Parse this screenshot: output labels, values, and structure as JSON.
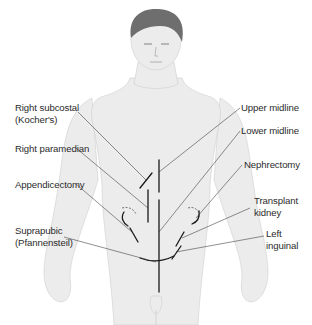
{
  "figure": {
    "colors": {
      "body_fill": "#ececec",
      "body_outline": "#cfcfcf",
      "hair": "#6e6e6e",
      "incision": "#1a1a1a",
      "label_text": "#2b2b2b"
    },
    "labels_left": [
      {
        "id": "right-subcostal",
        "lines": [
          "Right subcostal",
          "(Kocher's)"
        ]
      },
      {
        "id": "right-paramedian",
        "lines": [
          "Right paramedian"
        ]
      },
      {
        "id": "appendicectomy",
        "lines": [
          "Appendicectomy"
        ]
      },
      {
        "id": "suprapubic",
        "lines": [
          "Suprapubic",
          "(Pfannensteil)"
        ]
      }
    ],
    "labels_right": [
      {
        "id": "upper-midline",
        "lines": [
          "Upper midline"
        ]
      },
      {
        "id": "lower-midline",
        "lines": [
          "Lower midline"
        ]
      },
      {
        "id": "nephrectomy",
        "lines": [
          "Nephrectomy"
        ]
      },
      {
        "id": "transplant-kidney",
        "lines": [
          "Transplant",
          "kidney"
        ]
      },
      {
        "id": "left-inguinal",
        "lines": [
          "Left",
          "inguinal"
        ]
      }
    ]
  }
}
